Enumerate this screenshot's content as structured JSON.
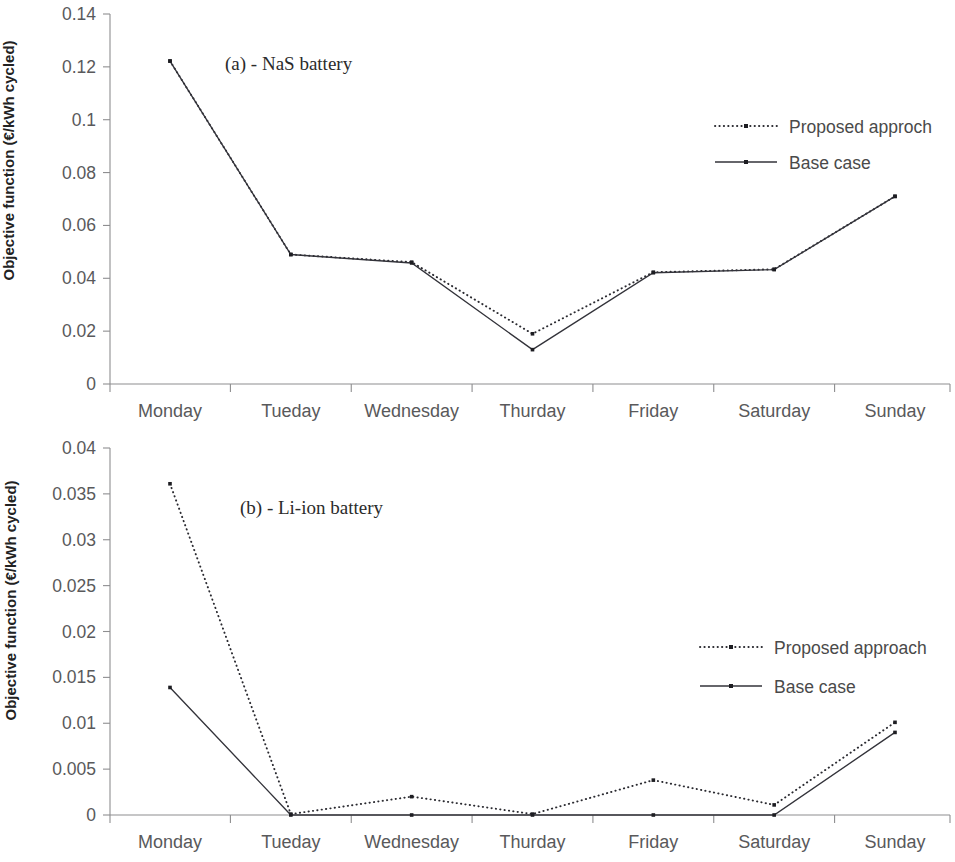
{
  "figure": {
    "axis_title": "Objective function (€/kWh cycled)"
  },
  "chart_data": [
    {
      "type": "line",
      "id": "panel-a",
      "title": "(a) - NaS battery",
      "xlabel": "",
      "ylabel": "Objective function (€/kWh cycled)",
      "categories": [
        "Monday",
        "Tueday",
        "Wednesday",
        "Thurday",
        "Friday",
        "Saturday",
        "Sunday"
      ],
      "ylim": [
        0,
        0.14
      ],
      "yticks": [
        0,
        0.02,
        0.04,
        0.06,
        0.08,
        0.1,
        0.12,
        0.14
      ],
      "ytick_labels": [
        "0",
        "0.02",
        "0.04",
        "0.06",
        "0.08",
        "0.1",
        "0.12",
        "0.14"
      ],
      "grid": false,
      "legend_position": "upper-right",
      "series": [
        {
          "name": "Proposed approch",
          "style": "dotted",
          "color": "#2a2a30",
          "values": [
            0.1222,
            0.049,
            0.0461,
            0.019,
            0.0423,
            0.0434,
            0.071
          ]
        },
        {
          "name": "Base case",
          "style": "solid",
          "color": "#33333a",
          "values": [
            0.1222,
            0.049,
            0.0458,
            0.013,
            0.0421,
            0.0433,
            0.071
          ]
        }
      ]
    },
    {
      "type": "line",
      "id": "panel-b",
      "title": "(b) - Li-ion battery",
      "xlabel": "",
      "ylabel": "Objective function (€/kWh cycled)",
      "categories": [
        "Monday",
        "Tueday",
        "Wednesday",
        "Thurday",
        "Friday",
        "Saturday",
        "Sunday"
      ],
      "ylim": [
        0,
        0.04
      ],
      "yticks": [
        0,
        0.005,
        0.01,
        0.015,
        0.02,
        0.025,
        0.03,
        0.035,
        0.04
      ],
      "ytick_labels": [
        "0",
        "0.005",
        "0.01",
        "0.015",
        "0.02",
        "0.025",
        "0.03",
        "0.035",
        "0.04"
      ],
      "grid": false,
      "legend_position": "center-right",
      "series": [
        {
          "name": "Proposed approach",
          "style": "dotted",
          "color": "#2a2a30",
          "values": [
            0.0361,
            0.0001,
            0.002,
            0.0001,
            0.0038,
            0.0011,
            0.0101
          ]
        },
        {
          "name": "Base case",
          "style": "solid",
          "color": "#33333a",
          "values": [
            0.0139,
            0.0,
            0.0,
            0.0,
            0.0,
            0.0,
            0.009
          ]
        }
      ]
    }
  ]
}
